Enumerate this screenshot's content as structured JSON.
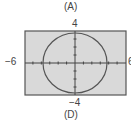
{
  "labels": {
    "top_caption": "(A)",
    "bottom_caption": "(D)"
  },
  "chart_data": {
    "type": "line",
    "title": "",
    "subtitle": "Graph of an ellipse/circle on a graphing calculator window",
    "xlabel": "",
    "ylabel": "",
    "xlim": [
      -6,
      6
    ],
    "ylim": [
      -4,
      4
    ],
    "tick_labels": {
      "xmin": "−6",
      "xmax": "6",
      "ymin": "−4",
      "ymax": "4"
    },
    "grid": false,
    "x_ticks_every": 1,
    "y_ticks_every": 1,
    "series": [
      {
        "name": "curve",
        "shape": "ellipse",
        "center": [
          0,
          0
        ],
        "x_radius": 3.8,
        "y_radius": 3.8
      }
    ],
    "background": "#d9d9d9",
    "curve_color": "#555555"
  }
}
